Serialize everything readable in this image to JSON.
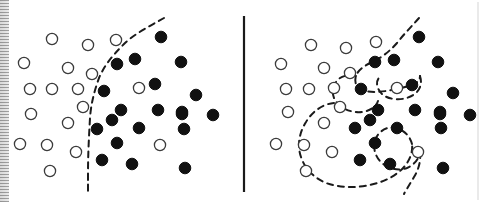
{
  "figure": {
    "title": "",
    "background_color": "#ffffff",
    "width": 486,
    "height": 202,
    "divider": {
      "x": 244,
      "y1": 16,
      "y2": 192,
      "color": "#1a1a1a",
      "width": 2.2
    },
    "right_edge_rule": {
      "x": 478,
      "y1": 2,
      "y2": 200,
      "color": "#d5d5d5",
      "width": 1
    },
    "scan_artifact": {
      "label": "scan-edge-band",
      "x": 0,
      "width": 9,
      "color": "#b9b9b9"
    }
  },
  "style": {
    "open_marker": {
      "fill": "#ffffff",
      "stroke": "#3b3b3b",
      "stroke_width": 1.3,
      "radius": 5.6,
      "class_label": "class-open"
    },
    "filled_marker": {
      "fill": "#111111",
      "stroke": "#111111",
      "stroke_width": 1,
      "radius": 5.8,
      "class_label": "class-filled"
    },
    "boundary": {
      "stroke": "#1a1a1a",
      "stroke_width": 2.0,
      "dash": "6 5",
      "fill": "none"
    }
  },
  "chart_data": {
    "type": "scatter",
    "title": "",
    "subtitle": "",
    "xlabel": "",
    "ylabel": "",
    "grid": false,
    "legend": [],
    "panels": [
      {
        "id": "left-panel",
        "name": "smooth-decision-boundary",
        "xlim": [
          0,
          243
        ],
        "ylim": [
          0,
          202
        ],
        "series": [
          {
            "name": "class-open",
            "marker": "open-circle",
            "points": [
              [
                52,
                39
              ],
              [
                88,
                45
              ],
              [
                116,
                40
              ],
              [
                24,
                63
              ],
              [
                68,
                68
              ],
              [
                92,
                74
              ],
              [
                30,
                89
              ],
              [
                52,
                89
              ],
              [
                78,
                89
              ],
              [
                139,
                88
              ],
              [
                31,
                114
              ],
              [
                83,
                107
              ],
              [
                68,
                123
              ],
              [
                20,
                144
              ],
              [
                47,
                145
              ],
              [
                76,
                152
              ],
              [
                160,
                145
              ],
              [
                50,
                171
              ]
            ]
          },
          {
            "name": "class-filled",
            "marker": "filled-circle",
            "points": [
              [
                161,
                37
              ],
              [
                117,
                64
              ],
              [
                135,
                59
              ],
              [
                181,
                62
              ],
              [
                104,
                91
              ],
              [
                155,
                84
              ],
              [
                196,
                95
              ],
              [
                158,
                110
              ],
              [
                121,
                110
              ],
              [
                182,
                112
              ],
              [
                213,
                115
              ],
              [
                112,
                120
              ],
              [
                182,
                114
              ],
              [
                97,
                129
              ],
              [
                139,
                128
              ],
              [
                184,
                129
              ],
              [
                117,
                143
              ],
              [
                102,
                160
              ],
              [
                132,
                164
              ],
              [
                185,
                168
              ]
            ]
          }
        ],
        "boundary_path": "M 164,18 C 150,26 134,34 124,44 C 112,56 104,66 99,78 C 94,92 91,104 90,118 C 89,136 88,154 88,174 C 88,182 88,188 88,193"
      },
      {
        "id": "right-panel",
        "name": "overfit-decision-boundary",
        "xlim": [
          243,
          486
        ],
        "ylim": [
          0,
          202
        ],
        "series": [
          {
            "name": "class-open",
            "marker": "open-circle",
            "points": [
              [
                311,
                45
              ],
              [
                346,
                48
              ],
              [
                376,
                42
              ],
              [
                281,
                64
              ],
              [
                324,
                68
              ],
              [
                350,
                73
              ],
              [
                286,
                89
              ],
              [
                309,
                89
              ],
              [
                334,
                88
              ],
              [
                397,
                88
              ],
              [
                288,
                112
              ],
              [
                340,
                107
              ],
              [
                324,
                123
              ],
              [
                276,
                144
              ],
              [
                304,
                145
              ],
              [
                332,
                152
              ],
              [
                418,
                152
              ],
              [
                306,
                171
              ]
            ]
          },
          {
            "name": "class-filled",
            "marker": "filled-circle",
            "points": [
              [
                419,
                37
              ],
              [
                375,
                62
              ],
              [
                394,
                60
              ],
              [
                438,
                62
              ],
              [
                361,
                89
              ],
              [
                412,
                85
              ],
              [
                453,
                93
              ],
              [
                415,
                110
              ],
              [
                378,
                110
              ],
              [
                440,
                112
              ],
              [
                470,
                115
              ],
              [
                370,
                120
              ],
              [
                440,
                114
              ],
              [
                355,
                128
              ],
              [
                397,
                128
              ],
              [
                441,
                128
              ],
              [
                375,
                143
              ],
              [
                360,
                160
              ],
              [
                390,
                164
              ],
              [
                443,
                168
              ]
            ]
          }
        ],
        "boundary_paths": [
          "M 419,18 C 412,26 404,34 397,43 C 389,52 381,58 372,62 C 364,66 358,70 356,76 C 354,82 356,87 362,90 C 370,93 382,92 392,90 C 402,88 410,86 414,84 C 418,82 420,80 420,76",
          "M 356,76 C 348,74 340,76 336,82 C 331,89 332,98 338,104 C 344,110 354,113 362,112 C 370,111 376,107 378,101",
          "M 420,76 C 422,82 421,88 416,93 C 410,98 402,100 394,99 C 386,98 380,94 378,88 C 376,83 377,79 381,76",
          "M 334,103 C 322,104 312,112 306,122 C 299,133 297,146 301,157 C 305,169 314,178 326,183 C 340,188 356,188 370,185 C 384,182 396,176 404,167 C 410,160 413,152 412,144",
          "M 412,144 C 410,136 404,130 396,128 C 388,126 380,130 376,138 C 372,147 375,157 382,163 C 389,169 399,171 407,168 C 414,165 419,159 420,152",
          "M 420,152 C 421,160 419,169 414,177 C 410,184 406,190 404,194"
        ]
      }
    ]
  },
  "annotations": {
    "left_caption": "",
    "right_caption": ""
  }
}
